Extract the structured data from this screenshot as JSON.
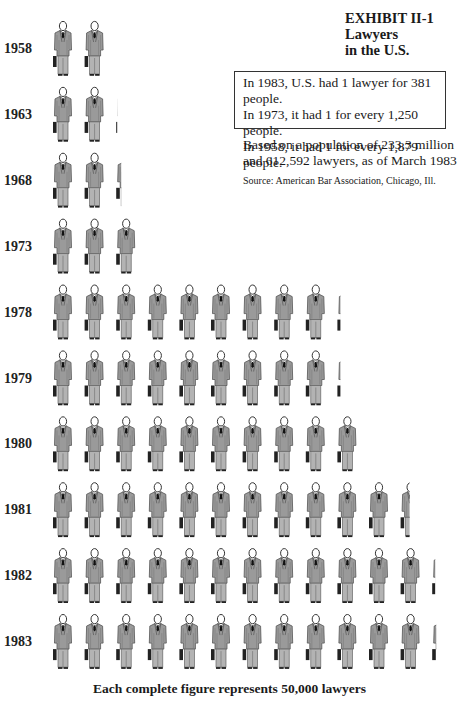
{
  "chart_data": {
    "type": "bar",
    "subtype": "pictogram",
    "title": "EXHIBIT II-1",
    "subtitle": [
      "Lawyers",
      "in the U.S."
    ],
    "categories": [
      "1958",
      "1963",
      "1968",
      "1973",
      "1978",
      "1979",
      "1980",
      "1981",
      "1982",
      "1983"
    ],
    "values": [
      2.0,
      2.1,
      2.3,
      3.0,
      9.2,
      9.2,
      10.0,
      11.5,
      12.2,
      12.25
    ],
    "unit": "figures (each complete figure = 50,000 lawyers)",
    "figure_value": 50000,
    "annotations": {
      "box_lines": [
        "In 1983, U.S. had 1 lawyer for 381 people.",
        "In 1973, it had 1 for every 1,250 people.",
        "In 1958, it had 1 for every 1,879 people."
      ],
      "based_on": "Based on a population of 233.3 million and 612,592 lawyers, as of March 1983",
      "source": "Source: American Bar Association, Chicago, Ill."
    },
    "footer": "Each complete figure represents 50,000 lawyers"
  },
  "header": {
    "exhibit": "EXHIBIT II-1",
    "title_line1": "Lawyers",
    "title_line2": "in the U.S."
  }
}
